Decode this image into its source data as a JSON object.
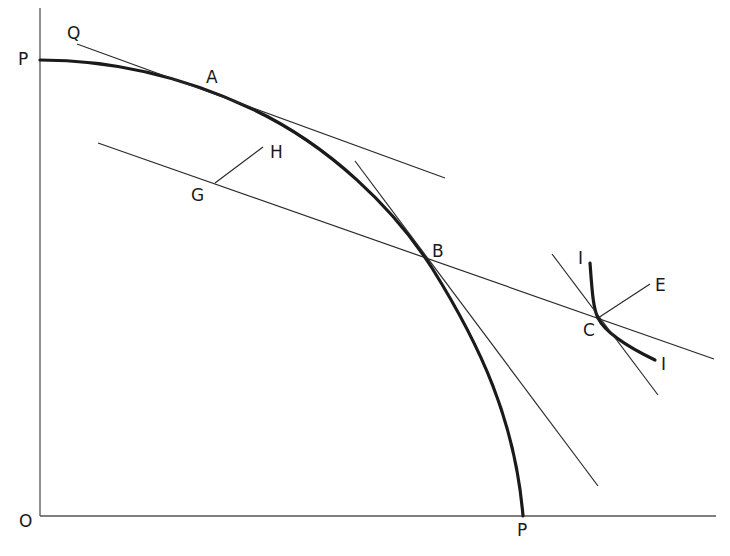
{
  "diagram": {
    "type": "production-possibility-frontier",
    "colors": {
      "background": "#ffffff",
      "ink": "#1a1a1a",
      "thin_line": "#2a2a2a",
      "axis": "#555555"
    },
    "labels": {
      "origin": "O",
      "ppf_top": "P",
      "ppf_bottom": "P",
      "Q": "Q",
      "A": "A",
      "B": "B",
      "C": "C",
      "E": "E",
      "G": "G",
      "H": "H",
      "I_top": "I",
      "I_bottom": "I"
    },
    "elements": [
      {
        "id": "y-axis",
        "kind": "axis"
      },
      {
        "id": "x-axis",
        "kind": "axis"
      },
      {
        "id": "ppf-curve",
        "kind": "curve",
        "from": "P (vertical axis)",
        "to": "P (horizontal axis)",
        "passes": [
          "A",
          "B"
        ]
      },
      {
        "id": "tangent-at-A",
        "kind": "line",
        "starts_at": "Q"
      },
      {
        "id": "price-line-GBC",
        "kind": "line",
        "passes": [
          "G",
          "B",
          "C"
        ]
      },
      {
        "id": "tangent-at-B",
        "kind": "line"
      },
      {
        "id": "segment-GH",
        "kind": "segment",
        "from": "G",
        "to": "H"
      },
      {
        "id": "indifference-curve-I",
        "kind": "curve",
        "touches": "C"
      },
      {
        "id": "tangent-at-C",
        "kind": "line"
      },
      {
        "id": "segment-CE",
        "kind": "segment",
        "from": "C",
        "to": "E"
      }
    ]
  }
}
